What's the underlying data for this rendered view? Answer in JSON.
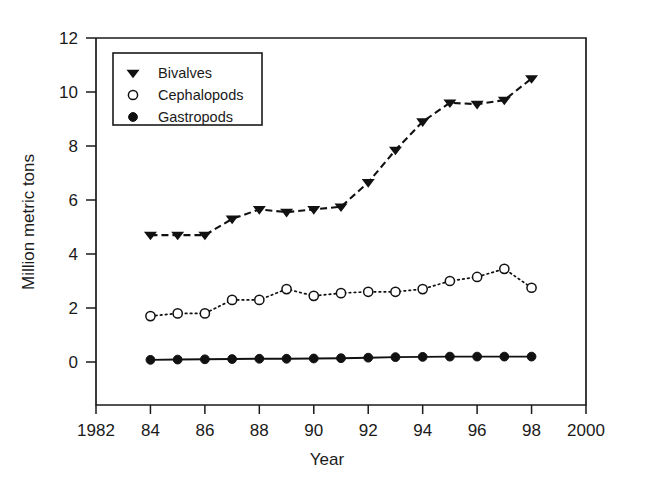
{
  "chart_data": {
    "type": "line",
    "title": "",
    "subtitle": "",
    "xlabel": "Year",
    "ylabel": "Million metric tons",
    "xlim": [
      1982,
      2000
    ],
    "ylim": [
      0,
      12
    ],
    "grid": false,
    "legend_position": "top-left",
    "x_tick_labels": [
      "1982",
      "84",
      "86",
      "88",
      "90",
      "92",
      "94",
      "96",
      "98",
      "2000"
    ],
    "x_tick_values": [
      1982,
      1984,
      1986,
      1988,
      1990,
      1992,
      1994,
      1996,
      1998,
      2000
    ],
    "y_tick_labels": [
      "0",
      "2",
      "4",
      "6",
      "8",
      "10",
      "12"
    ],
    "y_tick_values": [
      0,
      2,
      4,
      6,
      8,
      10,
      12
    ],
    "x": [
      1984,
      1985,
      1986,
      1987,
      1988,
      1989,
      1990,
      1991,
      1992,
      1993,
      1994,
      1995,
      1996,
      1997,
      1998
    ],
    "series": [
      {
        "name": "Bivalves",
        "marker": "filled-triangle-down",
        "linestyle": "dashed",
        "color": "#111111",
        "values": [
          4.7,
          4.7,
          4.7,
          5.3,
          5.65,
          5.55,
          5.65,
          5.75,
          6.65,
          7.85,
          8.9,
          9.6,
          9.55,
          9.7,
          10.5
        ]
      },
      {
        "name": "Cephalopods",
        "marker": "open-circle",
        "linestyle": "dotted",
        "color": "#111111",
        "values": [
          1.7,
          1.8,
          1.8,
          2.3,
          2.3,
          2.7,
          2.45,
          2.55,
          2.6,
          2.6,
          2.7,
          3.0,
          3.15,
          3.45,
          2.75
        ]
      },
      {
        "name": "Gastropods",
        "marker": "filled-circle",
        "linestyle": "solid",
        "color": "#111111",
        "values": [
          0.08,
          0.09,
          0.1,
          0.11,
          0.12,
          0.12,
          0.13,
          0.14,
          0.16,
          0.18,
          0.19,
          0.2,
          0.2,
          0.2,
          0.2
        ]
      }
    ]
  },
  "axes": {
    "y_axis_title": "Million metric tons",
    "x_axis_title": "Year"
  },
  "legend": {
    "entries": [
      {
        "label": "Bivalves",
        "marker": "filled-triangle-down"
      },
      {
        "label": "Cephalopods",
        "marker": "open-circle"
      },
      {
        "label": "Gastropods",
        "marker": "filled-circle"
      }
    ]
  }
}
